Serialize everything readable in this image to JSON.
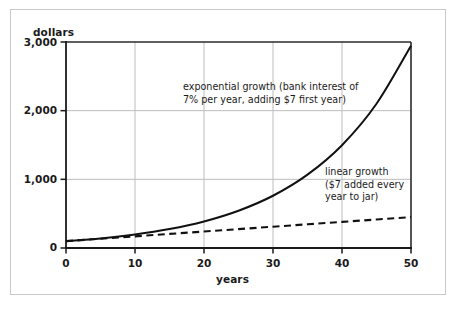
{
  "chart_data": {
    "type": "line",
    "title": "",
    "xlabel": "years",
    "ylabel": "dollars",
    "xlim": [
      0,
      50
    ],
    "ylim": [
      0,
      3000
    ],
    "grid": true,
    "legend_position": "inline-annotations",
    "xticks": [
      "0",
      "10",
      "20",
      "30",
      "40",
      "50"
    ],
    "xtick_values": [
      0,
      10,
      20,
      30,
      40,
      50
    ],
    "yticks": [
      "0",
      "1,000",
      "2,000",
      "3,000"
    ],
    "ytick_values": [
      0,
      1000,
      2000,
      3000
    ],
    "x": [
      0,
      5,
      10,
      15,
      20,
      25,
      30,
      35,
      40,
      45,
      50
    ],
    "series": [
      {
        "name": "exponential growth",
        "style": "solid",
        "color": "#111111",
        "values": [
          100,
          140,
          197,
          276,
          387,
          543,
          761,
          1068,
          1497,
          2100,
          2946
        ]
      },
      {
        "name": "linear growth",
        "style": "dashed",
        "color": "#111111",
        "values": [
          100,
          135,
          170,
          205,
          240,
          275,
          310,
          345,
          380,
          415,
          450
        ]
      }
    ],
    "annotations": [
      {
        "id": "exponential",
        "lines": [
          "exponential growth (bank interest of",
          "7% per year, adding $7 first year)"
        ]
      },
      {
        "id": "linear",
        "lines": [
          "linear growth",
          "($7 added every",
          "year to jar)"
        ]
      }
    ]
  },
  "axes": {
    "ylabel": "dollars",
    "xlabel": "years",
    "yticks": {
      "t3000": "3,000",
      "t2000": "2,000",
      "t1000": "1,000",
      "t0": "0"
    },
    "xticks": {
      "t0": "0",
      "t10": "10",
      "t20": "20",
      "t30": "30",
      "t40": "40",
      "t50": "50"
    }
  },
  "annotations": {
    "exponential": {
      "line1": "exponential growth (bank interest of",
      "line2": "7% per year, adding $7 first year)"
    },
    "linear": {
      "line1": "linear growth",
      "line2": "($7 added every",
      "line3": "year to jar)"
    }
  },
  "colors": {
    "frame": "#c9c9c9",
    "axis": "#1a1a1a",
    "grid": "#b8b8b8",
    "curve": "#111111",
    "background": "#ffffff"
  }
}
